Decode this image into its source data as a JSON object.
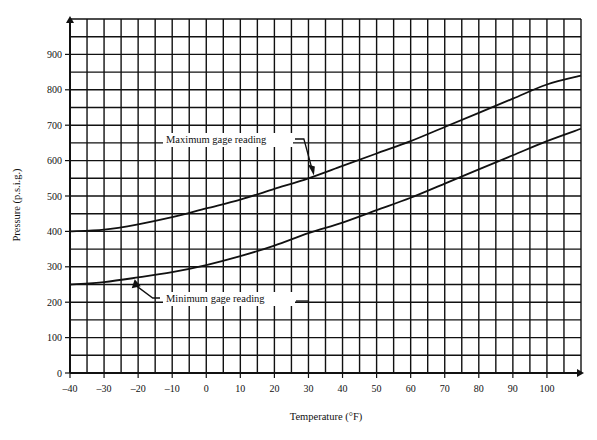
{
  "chart_data": {
    "type": "line",
    "title": "",
    "xlabel": "Temperature (°F)",
    "ylabel": "Pressure (p.s.i.g.)",
    "xlim": [
      -40,
      110
    ],
    "ylim": [
      0,
      1000
    ],
    "grid": true,
    "x_ticks": [
      -40,
      -30,
      -20,
      -10,
      0,
      10,
      20,
      30,
      40,
      50,
      60,
      70,
      80,
      90,
      100
    ],
    "y_ticks": [
      0,
      100,
      200,
      300,
      400,
      500,
      600,
      700,
      800,
      900
    ],
    "x_minor_step": 5,
    "y_minor_step": 50,
    "x": [
      -40,
      -30,
      -20,
      -10,
      0,
      10,
      20,
      30,
      40,
      50,
      60,
      70,
      80,
      90,
      100,
      110
    ],
    "series": [
      {
        "name": "Maximum gage reading",
        "values": [
          400,
          405,
          420,
          440,
          465,
          490,
          520,
          550,
          585,
          620,
          655,
          695,
          735,
          775,
          815,
          840
        ]
      },
      {
        "name": "Minimum gage reading",
        "values": [
          250,
          257,
          270,
          285,
          305,
          330,
          360,
          395,
          425,
          460,
          495,
          535,
          575,
          615,
          655,
          690
        ]
      }
    ],
    "annotations": [
      {
        "text": "Maximum gage reading",
        "points_to": {
          "x": 31,
          "y": 555
        }
      },
      {
        "text": "Minimum gage reading",
        "points_to": {
          "x": -21,
          "y": 268
        }
      }
    ],
    "legend": "none (inline annotations with leader arrows)"
  },
  "labels": {
    "xlabel": "Temperature (°F)",
    "ylabel": "Pressure (p.s.i.g.)",
    "max_annotation": "Maximum gage reading",
    "min_annotation": "Minimum gage reading"
  },
  "colors": {
    "line": "#111111",
    "grid": "#111111",
    "background": "#ffffff"
  }
}
